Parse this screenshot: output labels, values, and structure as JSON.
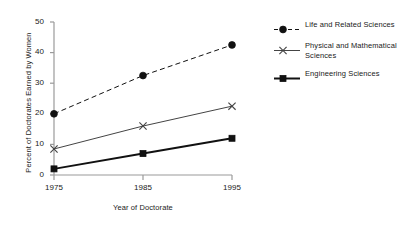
{
  "chart_data": {
    "type": "line",
    "title": "",
    "xlabel": "Year of Doctorate",
    "ylabel": "Percent of Doctorates Earned by Women",
    "categories": [
      "1975",
      "1985",
      "1995"
    ],
    "x": [
      1975,
      1985,
      1995
    ],
    "xlim": [
      1975,
      1995
    ],
    "ylim": [
      0,
      50
    ],
    "yticks": [
      "0",
      "10",
      "20",
      "30",
      "40",
      "50"
    ],
    "ytick_values": [
      0,
      10,
      20,
      30,
      40,
      50
    ],
    "xticks": [
      "1975",
      "1985",
      "1995"
    ],
    "grid": false,
    "legend_position": "right",
    "series": [
      {
        "name": "Life and Related Sciences",
        "values": [
          20,
          32.5,
          42.5
        ],
        "marker": "circle",
        "linestyle": "dashed",
        "color": "#111111",
        "linewidth": 1
      },
      {
        "name": "Physical and Mathematical Sciences",
        "values": [
          8.5,
          16,
          22.5
        ],
        "marker": "x",
        "linestyle": "solid",
        "color": "#444444",
        "linewidth": 1
      },
      {
        "name": "Engineering Sciences",
        "values": [
          2,
          7,
          12
        ],
        "marker": "square",
        "linestyle": "solid",
        "color": "#111111",
        "linewidth": 2
      }
    ]
  },
  "axes": {
    "line_color": "#9a9a9a"
  }
}
